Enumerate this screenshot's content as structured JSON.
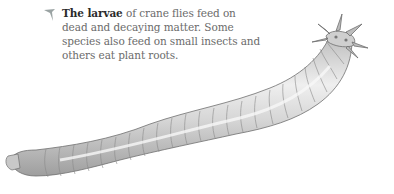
{
  "caption": {
    "icon": "pointer-arrow-icon",
    "bold_lead": "The larvae",
    "body": " of crane flies feed on dead and decaying matter. Some species also feed on small insects and others eat plant roots."
  },
  "illustration": {
    "subject": "crane fly larva",
    "colors": {
      "body": "#d9d9d9",
      "shade": "#a8a8a8",
      "outline": "#6f6f6f",
      "highlight": "#f4f4f4",
      "icon": "#9aa3a3"
    }
  }
}
